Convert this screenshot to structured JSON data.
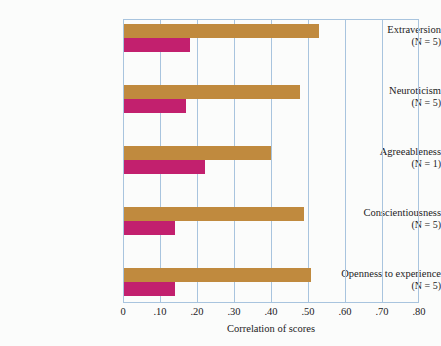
{
  "chart_data": {
    "type": "bar",
    "orientation": "horizontal",
    "title": "",
    "xlabel": "Correlation of scores",
    "ylabel": "",
    "xlim": [
      0,
      0.8
    ],
    "xticks": [
      "0",
      ".10",
      ".20",
      ".30",
      ".40",
      ".50",
      ".60",
      ".70",
      ".80"
    ],
    "xtick_values": [
      0,
      0.1,
      0.2,
      0.3,
      0.4,
      0.5,
      0.6,
      0.7,
      0.8
    ],
    "grid": true,
    "legend": "none",
    "categories": [
      "Extraversion",
      "Neuroticism",
      "Agreeableness",
      "Conscientiousness",
      "Openness to experience"
    ],
    "category_notes": [
      "(N = 5)",
      "(N = 5)",
      "(N = 1)",
      "(N = 5)",
      "(N = 5)"
    ],
    "series": [
      {
        "name": "upper-bar",
        "color": "#c08a3e",
        "values": [
          0.53,
          0.48,
          0.4,
          0.49,
          0.51
        ]
      },
      {
        "name": "lower-bar",
        "color": "#c2206e",
        "values": [
          0.18,
          0.17,
          0.22,
          0.14,
          0.14
        ]
      }
    ],
    "colors": {
      "upper_bar": "#c08a3e",
      "lower_bar": "#c2206e",
      "gridline": "#a8c4de",
      "background": "#fbfcfb",
      "text": "#1b1b1b"
    }
  }
}
